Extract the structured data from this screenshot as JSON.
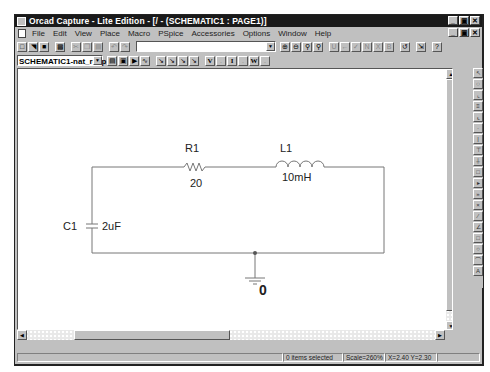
{
  "window": {
    "title": "Orcad Capture - Lite Edition - [/ - (SCHEMATIC1 : PAGE1)]",
    "controls": [
      "minimize",
      "maximize",
      "close"
    ]
  },
  "menubar": {
    "items": [
      {
        "label": "File"
      },
      {
        "label": "Edit"
      },
      {
        "label": "View"
      },
      {
        "label": "Place"
      },
      {
        "label": "Macro"
      },
      {
        "label": "PSpice"
      },
      {
        "label": "Accessories"
      },
      {
        "label": "Options"
      },
      {
        "label": "Window"
      },
      {
        "label": "Help"
      }
    ]
  },
  "toolbar1": {
    "buttons": [
      "new-icon",
      "open-icon",
      "save-icon",
      "print-icon",
      "cut-icon",
      "copy-icon",
      "paste-icon",
      "undo-icon",
      "redo-icon"
    ],
    "part_combo_value": "",
    "zoom_buttons": [
      "zoom-in-icon",
      "zoom-out-icon",
      "zoom-area-icon",
      "zoom-all-icon"
    ],
    "misc_buttons": [
      "annotate-icon",
      "back-annotate-icon",
      "drc-icon",
      "netlist-icon",
      "crossref-icon",
      "bom-icon",
      "undo-history-icon",
      "project-manager-icon",
      "help-icon"
    ]
  },
  "toolbar2": {
    "profile_value": "SCHEMATIC1-nat_resp",
    "sim_buttons": [
      "edit-profile-icon",
      "new-profile-icon",
      "run-pspice-icon",
      "view-results-icon"
    ],
    "marker_buttons": [
      "voltage-marker-icon",
      "voltage-differential-icon",
      "current-marker-icon",
      "power-marker-icon"
    ],
    "probe_labels": {
      "v": "V",
      "i": "I",
      "w": "W"
    }
  },
  "palette": {
    "tools": [
      "select",
      "part",
      "wire",
      "net-alias",
      "bus",
      "junction",
      "bus-entry",
      "power",
      "ground",
      "hierarchical-block",
      "hierarchical-pin",
      "off-page-connector",
      "no-connect",
      "line",
      "polyline",
      "rectangle",
      "ellipse",
      "arc",
      "text"
    ]
  },
  "schematic": {
    "components": [
      {
        "ref": "R1",
        "value": "20",
        "type": "resistor"
      },
      {
        "ref": "L1",
        "value": "10mH",
        "type": "inductor"
      },
      {
        "ref": "C1",
        "value": "2uF",
        "type": "capacitor"
      }
    ],
    "ground_label": "0"
  },
  "statusbar": {
    "selection": "0 items selected",
    "scale": "Scale=260%",
    "coords": "X=2.40  Y=2.30"
  }
}
